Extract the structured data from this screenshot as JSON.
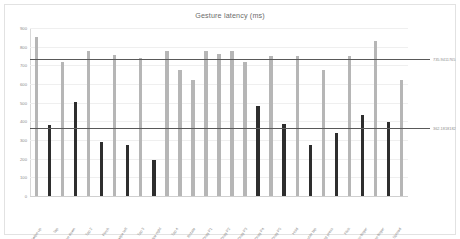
{
  "chart_data": {
    "type": "bar",
    "title": "Gesture latency (ms)",
    "xlabel": "",
    "ylabel": "",
    "ylim": [
      0,
      900
    ],
    "ytick_labels": [
      "900",
      "800",
      "700",
      "600",
      "500",
      "400",
      "300",
      "200",
      "100",
      "0"
    ],
    "ytick_values": [
      900,
      800,
      700,
      600,
      500,
      400,
      300,
      200,
      100,
      0
    ],
    "grid": true,
    "legend": "none",
    "categories": [
      "Swipe up",
      "Tap",
      "Swipe down",
      "Tap 2",
      "Pinch",
      "Swipe left",
      "Tap 3",
      "Swipe right",
      "Tap 4",
      "Rotate",
      "Drag P1",
      "Drag P2",
      "Drag P3",
      "Drag P4",
      "Drag P5",
      "Hold",
      "Double tap",
      "Long press",
      "Flick",
      "Two finger",
      "Three finger",
      "Spread"
    ],
    "series": [
      {
        "name": "Series 1",
        "color": "#b6b6b6",
        "values": [
          853,
          718,
          775,
          758,
          742,
          775,
          757,
          778,
          718,
          752,
          752,
          735,
          675,
          748,
          752,
          762,
          757,
          830,
          752,
          620,
          0,
          0
        ]
      },
      {
        "name": "Series 2",
        "color": "#2e2e2e",
        "values": [
          382,
          506,
          288,
          272,
          193,
          0,
          0,
          0,
          0,
          481,
          385,
          381,
          272,
          337,
          337,
          355,
          432,
          398,
          0,
          0,
          0,
          0
        ]
      }
    ],
    "bars": [
      {
        "value": 853,
        "series": 0
      },
      {
        "value": 382,
        "series": 1
      },
      {
        "value": 718,
        "series": 0
      },
      {
        "value": 506,
        "series": 1
      },
      {
        "value": 775,
        "series": 0
      },
      {
        "value": 288,
        "series": 1
      },
      {
        "value": 758,
        "series": 0
      },
      {
        "value": 272,
        "series": 1
      },
      {
        "value": 742,
        "series": 0
      },
      {
        "value": 193,
        "series": 1
      },
      {
        "value": 775,
        "series": 0
      },
      {
        "value": 675,
        "series": 0
      },
      {
        "value": 620,
        "series": 0
      },
      {
        "value": 775,
        "series": 0
      },
      {
        "value": 762,
        "series": 0
      },
      {
        "value": 778,
        "series": 0
      },
      {
        "value": 718,
        "series": 0
      },
      {
        "value": 481,
        "series": 1
      },
      {
        "value": 752,
        "series": 0
      },
      {
        "value": 385,
        "series": 1
      },
      {
        "value": 752,
        "series": 0
      },
      {
        "value": 272,
        "series": 1
      },
      {
        "value": 675,
        "series": 0
      },
      {
        "value": 337,
        "series": 1
      },
      {
        "value": 748,
        "series": 0
      },
      {
        "value": 432,
        "series": 1
      },
      {
        "value": 830,
        "series": 0
      },
      {
        "value": 398,
        "series": 1
      },
      {
        "value": 620,
        "series": 0
      }
    ],
    "reference_lines": [
      {
        "value": 735.9411765,
        "label": "735.9411765",
        "color": "#595959"
      },
      {
        "value": 362.1818182,
        "label": "362.1818182",
        "color": "#595959"
      }
    ]
  }
}
